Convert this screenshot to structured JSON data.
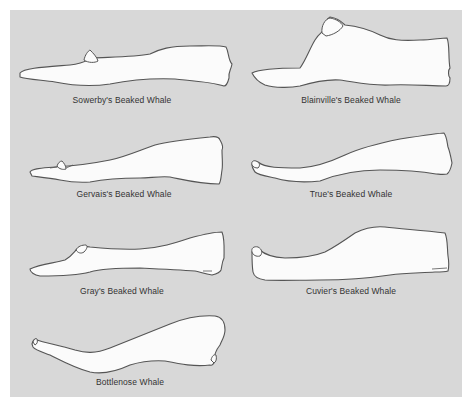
{
  "figure": {
    "background_color": "#d8d8d8",
    "outline_color": "#555555",
    "fill_color": "#fbfbfb",
    "label_color": "#333333"
  },
  "skulls": [
    {
      "name": "Sowerby's Beaked Whale",
      "position": "row1-left"
    },
    {
      "name": "Blainville's Beaked Whale",
      "position": "row1-right"
    },
    {
      "name": "Gervais's Beaked Whale",
      "position": "row2-left"
    },
    {
      "name": "True's Beaked Whale",
      "position": "row2-right"
    },
    {
      "name": "Gray's Beaked Whale",
      "position": "row3-left"
    },
    {
      "name": "Cuvier's Beaked Whale",
      "position": "row3-right"
    },
    {
      "name": "Bottlenose Whale",
      "position": "row4-left"
    }
  ]
}
